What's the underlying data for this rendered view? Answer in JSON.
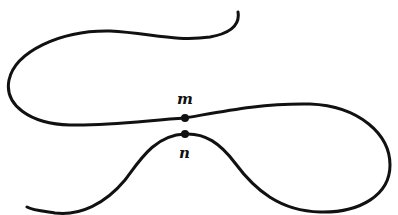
{
  "diagram": {
    "stroke_color": "#111111",
    "background": "#ffffff",
    "points": [
      {
        "id": "m",
        "label": "m",
        "x": 185,
        "y": 118
      },
      {
        "id": "n",
        "label": "n",
        "x": 185,
        "y": 134
      }
    ]
  }
}
